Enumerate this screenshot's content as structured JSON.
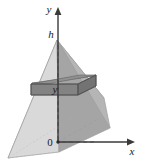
{
  "figure": {
    "width": 143,
    "height": 168,
    "background": "#ffffff"
  },
  "axes": {
    "y_axis_label": "y",
    "x_axis_label": "x",
    "origin_label": "0",
    "axis_color": "#3a3a3a"
  },
  "annotations": {
    "height_label": "h",
    "cross_section_label": "y"
  },
  "colors": {
    "face_front_left": "#d4d4d4",
    "face_front_right": "#a8a8a8",
    "face_back_left": "#c4c4c4",
    "face_right_side": "#9a9a9a",
    "slab_top": "#8f8f8f",
    "slab_front": "#7f7f7f",
    "slab_right": "#6e6e6e",
    "outline": "#8a8a8a",
    "axis": "#3a3a3a",
    "dashed": "#5a5a5a"
  },
  "geometry": {
    "apex": [
      57,
      40
    ],
    "base_front": [
      59,
      152
    ],
    "base_left": [
      8,
      158
    ],
    "base_right": [
      110,
      128
    ],
    "base_back": [
      104,
      98
    ],
    "slab_height_y": 88,
    "description": "square pyramid of height h with cross-section square at height y"
  }
}
